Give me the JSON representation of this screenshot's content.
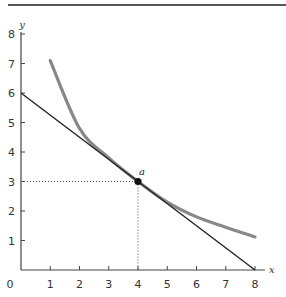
{
  "chart_data": {
    "type": "line",
    "title": "",
    "xlabel": "x",
    "ylabel": "y",
    "xlim": [
      0,
      8
    ],
    "ylim": [
      0,
      8
    ],
    "grid": false,
    "x_ticks": [
      0,
      1,
      2,
      3,
      4,
      5,
      6,
      7,
      8
    ],
    "y_ticks": [
      1,
      2,
      3,
      4,
      5,
      6,
      7,
      8
    ],
    "series": [
      {
        "name": "indifference-curve",
        "color": "#888888",
        "x": [
          1,
          2,
          3,
          4,
          5,
          6,
          7,
          8
        ],
        "y": [
          7.1,
          4.8,
          3.8,
          3.0,
          2.3,
          1.8,
          1.45,
          1.12
        ]
      },
      {
        "name": "budget-line",
        "color": "#222222",
        "x": [
          0,
          8
        ],
        "y": [
          6,
          0
        ]
      }
    ],
    "annotations": [
      {
        "label": "a",
        "x": 4,
        "y": 3,
        "type": "point",
        "guides": "dotted"
      }
    ]
  }
}
